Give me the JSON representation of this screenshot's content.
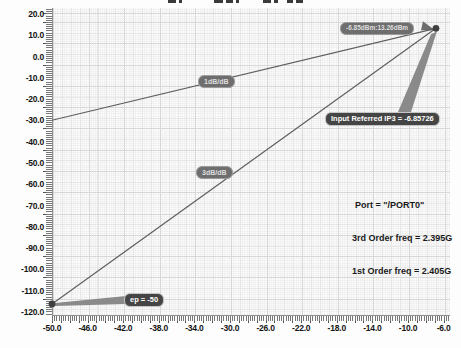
{
  "labels": {
    "marker_badge": "-6.85dBm:13.26dBm",
    "ip3_badge": "Input Referred IP3 = -6.85726",
    "ep_badge": "ep = -50",
    "slope1_badge": "1dB/dB",
    "slope3_badge": "3dB/dB",
    "port": "Port = \"/PORT0\"",
    "freq3": "3rd Order freq = 2.395G",
    "freq1": "1st Order freq = 2.405G"
  },
  "colors": {
    "trace": "#5f5f5f",
    "marker_dot": "#3f3f3f",
    "wedge": "#8a8a8a",
    "badge_bg": "#6e6e6e"
  },
  "chart_data": {
    "type": "line",
    "title": "",
    "xlabel": "",
    "ylabel": "",
    "xlim": [
      -50,
      -6
    ],
    "ylim": [
      -120,
      20
    ],
    "x_tick_labels": [
      "-50.0",
      "-46.0",
      "-42.0",
      "-38.0",
      "-34.0",
      "-30.0",
      "-26.0",
      "-22.0",
      "-18.0",
      "-14.0",
      "-10.0",
      "-6.0"
    ],
    "y_tick_labels": [
      "20.0",
      "10.0",
      "0.0",
      "-10.0",
      "-20.0",
      "-30.0",
      "-40.0",
      "-50.0",
      "-60.0",
      "-70.0",
      "-80.0",
      "-90.0",
      "-100.0",
      "-110.0",
      "-120.0"
    ],
    "grid": true,
    "legend": false,
    "series": [
      {
        "name": "1st Order",
        "slope_db_per_db": 1,
        "x": [
          -50,
          -6.85726
        ],
        "y": [
          -29.9,
          13.26
        ]
      },
      {
        "name": "3rd Order",
        "slope_db_per_db": 3,
        "x": [
          -50,
          -6.85726
        ],
        "y": [
          -116.2,
          13.26
        ]
      }
    ],
    "markers": [
      {
        "name": "intercept-point",
        "x": -6.85726,
        "y": 13.26,
        "label": "-6.85dBm:13.26dBm"
      },
      {
        "name": "extrapolation-point",
        "x": -50,
        "y": -116.2,
        "label": "ep = -50"
      }
    ],
    "annotations": [
      "Input Referred IP3 = -6.85726",
      "Port = \"/PORT0\"",
      "3rd Order freq = 2.395G",
      "1st Order freq = 2.405G"
    ]
  }
}
